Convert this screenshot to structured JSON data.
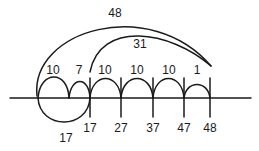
{
  "diagram": {
    "type": "open number line",
    "big_arc_labels": {
      "total": "48",
      "difference": "31"
    },
    "jump_labels": [
      "10",
      "7",
      "10",
      "10",
      "10",
      "1"
    ],
    "below_arc_label": "17",
    "tick_labels": [
      "17",
      "27",
      "37",
      "47",
      "48"
    ],
    "line_color": "#1a1a1a"
  }
}
